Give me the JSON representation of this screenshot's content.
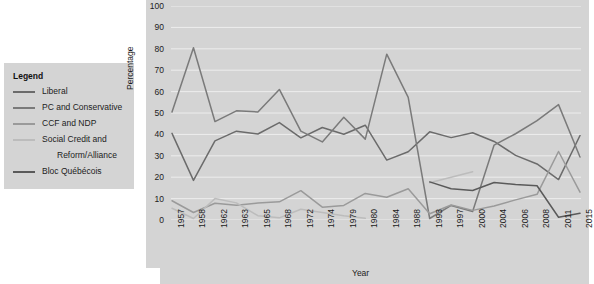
{
  "chart_data": {
    "type": "line",
    "title": "",
    "xlabel": "Year",
    "ylabel": "Percentage",
    "ylim": [
      0,
      100
    ],
    "yticks": [
      0,
      10,
      20,
      30,
      40,
      50,
      60,
      70,
      80,
      90,
      100
    ],
    "grid": true,
    "legend_position": "left-outside",
    "legend_title": "Legend",
    "categories": [
      "1957",
      "1958",
      "1962",
      "1963",
      "1965",
      "1968",
      "1972",
      "1974",
      "1979",
      "1980",
      "1984",
      "1988",
      "1993",
      "1997",
      "2000",
      "2004",
      "2006",
      "2008",
      "2011",
      "2015"
    ],
    "series": [
      {
        "name": "Liberal",
        "color": "#6b6b6b",
        "values": [
          40.5,
          18.5,
          37.0,
          41.5,
          40.2,
          45.5,
          38.4,
          43.2,
          40.1,
          44.3,
          28.0,
          31.9,
          41.2,
          38.5,
          40.8,
          36.7,
          30.2,
          26.2,
          18.9,
          39.5
        ]
      },
      {
        "name": "PC and Conservative",
        "color": "#7a7a7a",
        "values": [
          50.5,
          80.5,
          46.0,
          51.0,
          50.5,
          61.0,
          41.5,
          36.5,
          48.0,
          37.8,
          77.5,
          57.3,
          0.7,
          6.8,
          4.0,
          35.0,
          40.3,
          46.4,
          53.9,
          29.4
        ]
      },
      {
        "name": "CCF and NDP",
        "color": "#9a9a9a",
        "values": [
          9.0,
          3.5,
          7.8,
          6.9,
          7.9,
          8.5,
          13.7,
          6.0,
          6.8,
          12.4,
          10.6,
          14.6,
          2.9,
          7.0,
          4.5,
          6.5,
          9.4,
          12.0,
          32.0,
          13.0
        ]
      },
      {
        "name": "Social Credit and Reform/Alliance",
        "color": "#bcbcbc",
        "values": [
          5.5,
          0.7,
          10.0,
          8.0,
          2.0,
          1.0,
          5.0,
          3.5,
          2.0,
          0.8,
          null,
          null,
          17.4,
          20.0,
          22.5,
          null,
          null,
          null,
          null,
          null
        ]
      },
      {
        "name": "Bloc Québécois",
        "color": "#5a5a5a",
        "values": [
          null,
          null,
          null,
          null,
          null,
          null,
          null,
          null,
          null,
          null,
          null,
          null,
          17.8,
          14.6,
          13.8,
          17.5,
          16.6,
          16.0,
          1.3,
          3.2
        ]
      }
    ]
  },
  "legend": {
    "title": "Legend",
    "items": [
      {
        "label": "Liberal",
        "color": "#6b6b6b",
        "indent": false
      },
      {
        "label": "PC and Conservative",
        "color": "#7a7a7a",
        "indent": false
      },
      {
        "label": "CCF and NDP",
        "color": "#9a9a9a",
        "indent": false
      },
      {
        "label": "Social Credit and",
        "color": "#bcbcbc",
        "indent": false
      },
      {
        "label": "Reform/Alliance",
        "color": "",
        "indent": true
      },
      {
        "label": "Bloc Québécois",
        "color": "#5a5a5a",
        "indent": false
      }
    ]
  },
  "axes": {
    "y_title": "Percentage",
    "x_title": "Year"
  },
  "colors": {
    "panel_background": "#d4d4d4",
    "gridline": "#ededed",
    "text": "#1c1c1c",
    "page_background": "#ffffff"
  }
}
